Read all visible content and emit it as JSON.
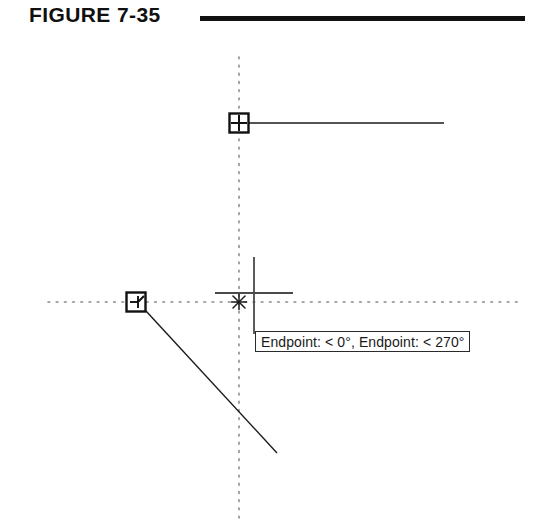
{
  "figure": {
    "label": "FIGURE 7-35",
    "rule_color": "#111111"
  },
  "canvas": {
    "background": "#ffffff",
    "ink_color": "#1a1a1a",
    "tracking_color": "#8c8c8c",
    "crosshair_color": "#4a4a4a"
  },
  "tooltip": {
    "text": "Endpoint: < 0°,  Endpoint: < 270°",
    "first_snap": "Endpoint",
    "first_angle": "0°",
    "second_snap": "Endpoint",
    "second_angle": "270°",
    "border_color": "#2b2b2b",
    "background": "#ffffff"
  },
  "markers": {
    "endpoint_marker_label": "Endpoint snap marker",
    "perpendicular_marker_label": "Perpendicular snap marker",
    "tracking_intersection_label": "Tracking intersection marker"
  },
  "geometry": {
    "horizontal_line_label": "Horizontal line object",
    "diagonal_line_label": "Diagonal line object",
    "vertical_tracking_label": "Vertical polar tracking path",
    "horizontal_tracking_label": "Horizontal polar tracking path"
  }
}
